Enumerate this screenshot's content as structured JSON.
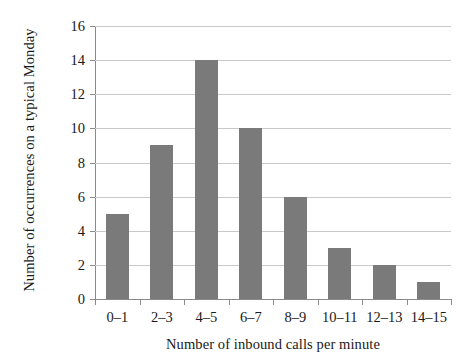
{
  "chart_data": {
    "type": "bar",
    "title": "",
    "subtitle": "",
    "xlabel": "Number of inbound calls per minute",
    "ylabel": "Number of occurrences on a typical Monday",
    "categories": [
      "0–1",
      "2–3",
      "4–5",
      "6–7",
      "8–9",
      "10–11",
      "12–13",
      "14–15"
    ],
    "values": [
      5,
      9,
      14,
      10,
      6,
      3,
      2,
      1
    ],
    "ylim": [
      0,
      16
    ],
    "ytick_values": [
      0,
      2,
      4,
      6,
      8,
      10,
      12,
      14,
      16
    ],
    "ytick_labels": [
      "0",
      "2",
      "4",
      "6",
      "8",
      "10",
      "12",
      "14",
      "16"
    ],
    "grid": "horizontal",
    "legend": "none",
    "bar_color": "#7a7a7a",
    "gridline_color": "#c9c9c9",
    "axis_color": "#8a8a8a",
    "background_color": "#ffffff",
    "text_color": "#1a1a1a"
  }
}
